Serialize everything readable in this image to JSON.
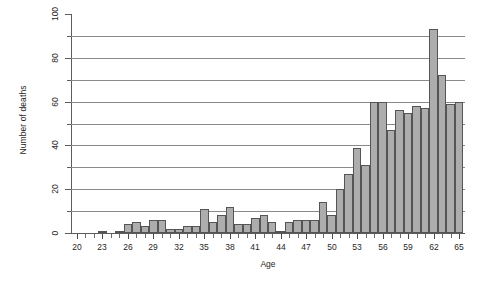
{
  "chart_data": {
    "type": "bar",
    "title": "",
    "subtitle": "",
    "xlabel": "Age",
    "ylabel": "Number of deaths",
    "xlim": [
      19.3,
      65.7
    ],
    "ylim": [
      0,
      100
    ],
    "ytick_labels": [
      "0",
      "20",
      "40",
      "60",
      "80",
      "100"
    ],
    "ytick_values": [
      0,
      20,
      40,
      60,
      80,
      100
    ],
    "yminor_values": [
      10,
      30,
      50,
      70,
      90
    ],
    "gridlines": [
      10,
      20,
      30,
      40,
      50,
      60,
      70,
      80,
      90
    ],
    "grid": true,
    "legend": null,
    "xtick_labels": [
      "20",
      "23",
      "26",
      "29",
      "32",
      "35",
      "38",
      "41",
      "44",
      "47",
      "50",
      "53",
      "56",
      "59",
      "62",
      "65"
    ],
    "xtick_values": [
      20,
      23,
      26,
      29,
      32,
      35,
      38,
      41,
      44,
      47,
      50,
      53,
      56,
      59,
      62,
      65
    ],
    "categories": [
      20,
      21,
      22,
      23,
      24,
      25,
      26,
      27,
      28,
      29,
      30,
      31,
      32,
      33,
      34,
      35,
      36,
      37,
      38,
      39,
      40,
      41,
      42,
      43,
      44,
      45,
      46,
      47,
      48,
      49,
      50,
      51,
      52,
      53,
      54,
      55,
      56,
      57,
      58,
      59,
      60,
      61,
      62,
      63,
      64,
      65
    ],
    "values": [
      0,
      0,
      0,
      1,
      0,
      1,
      4,
      5,
      3,
      6,
      6,
      2,
      2,
      3,
      3,
      11,
      5,
      8,
      12,
      4,
      4,
      7,
      8,
      5,
      1,
      5,
      6,
      6,
      6,
      14,
      8,
      20,
      27,
      39,
      31,
      60,
      60,
      47,
      56,
      55,
      58,
      57,
      93,
      72,
      59,
      60
    ],
    "bar_color": "#adadad",
    "bar_edge_color": "#555555",
    "axis_color": "#5c5c5c",
    "grid_color": "#8a8a8a",
    "text_color": "#262626",
    "background": "#ffffff"
  }
}
